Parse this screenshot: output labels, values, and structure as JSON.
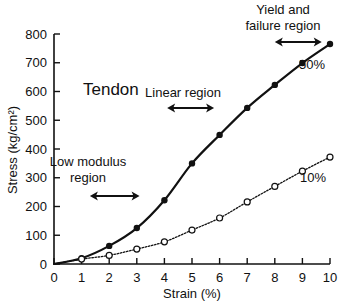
{
  "chart_data": {
    "type": "line",
    "title": "Tendon",
    "xlabel": "Strain (%)",
    "ylabel": "Stress (kg/cm²)",
    "xlim": [
      0,
      10
    ],
    "ylim": [
      0,
      800
    ],
    "grid": false,
    "x_ticks": [
      0,
      1,
      2,
      3,
      4,
      5,
      6,
      7,
      8,
      9,
      10
    ],
    "y_ticks": [
      0,
      100,
      200,
      300,
      400,
      500,
      600,
      700,
      800
    ],
    "x": [
      0,
      1,
      2,
      3,
      4,
      5,
      6,
      7,
      8,
      9,
      10
    ],
    "series": [
      {
        "name": "50%",
        "style": "solid",
        "marker": "filled-circle",
        "values": [
          0,
          20,
          63,
          125,
          222,
          350,
          449,
          543,
          623,
          699,
          765
        ]
      },
      {
        "name": "10%",
        "style": "dotted",
        "marker": "open-circle",
        "values": [
          0,
          17,
          30,
          52,
          77,
          118,
          160,
          216,
          270,
          323,
          372
        ]
      }
    ],
    "annotations": [
      {
        "text": "Low modulus region",
        "lines": [
          "Low modulus",
          "region"
        ],
        "arrow_x_range": [
          1.3,
          3.1
        ]
      },
      {
        "text": "Linear region",
        "lines": [
          "Linear region"
        ],
        "arrow_x_range": [
          4.1,
          5.8
        ]
      },
      {
        "text": "Yield and failure region",
        "lines": [
          "Yield and",
          "failure region"
        ],
        "arrow_x_range": [
          8.0,
          9.7
        ]
      }
    ]
  }
}
